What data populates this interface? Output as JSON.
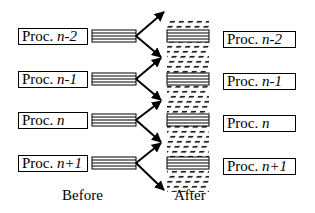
{
  "diagram": {
    "before_label": "Before",
    "after_label": "After",
    "before_processes": [
      {
        "prefix": "Proc. ",
        "index": "n-2"
      },
      {
        "prefix": "Proc. ",
        "index": "n-1"
      },
      {
        "prefix": "Proc. ",
        "index": "n"
      },
      {
        "prefix": "Proc. ",
        "index": "n+1"
      }
    ],
    "after_processes": [
      {
        "prefix": "Proc. ",
        "index": "n-2"
      },
      {
        "prefix": "Proc. ",
        "index": "n-1"
      },
      {
        "prefix": "Proc. ",
        "index": "n"
      },
      {
        "prefix": "Proc. ",
        "index": "n+1"
      }
    ],
    "colors": {
      "stroke": "#000000",
      "background": "#ffffff"
    }
  }
}
